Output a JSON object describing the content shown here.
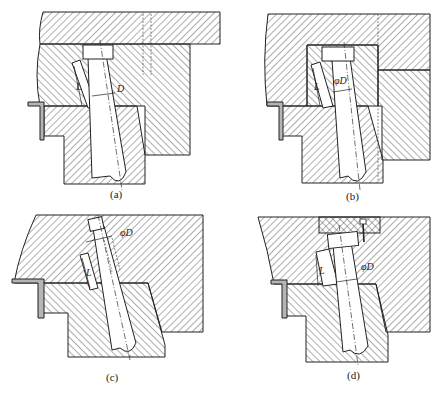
{
  "figure": {
    "panels": [
      {
        "id": "a",
        "caption": "(a)",
        "dimension_labels": [
          "D",
          "L"
        ]
      },
      {
        "id": "b",
        "caption": "(b)",
        "dimension_labels": [
          "φD",
          "L"
        ]
      },
      {
        "id": "c",
        "caption": "(c)",
        "dimension_labels": [
          "φD",
          "L"
        ]
      },
      {
        "id": "d",
        "caption": "(d)",
        "dimension_labels": [
          "φD",
          "L"
        ]
      }
    ]
  },
  "colors": {
    "line": "#222222",
    "background": "#ffffff",
    "hatch": "#333333"
  }
}
